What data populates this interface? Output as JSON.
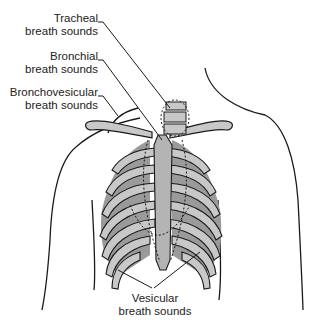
{
  "diagram": {
    "labels": [
      {
        "id": "tracheal",
        "line1": "Tracheal",
        "line2": "breath sounds"
      },
      {
        "id": "bronchial",
        "line1": "Bronchial",
        "line2": "breath sounds"
      },
      {
        "id": "bronchovesicular",
        "line1": "Bronchovesicular",
        "line2": "breath sounds"
      },
      {
        "id": "vesicular",
        "line1": "Vesicular",
        "line2": "breath sounds"
      }
    ],
    "colors": {
      "outline": "#1a1a1a",
      "rib_light": "#c8c8c8",
      "lung_dark": "#9a9a9a",
      "sternum": "#b4b4b4",
      "background": "#ffffff"
    }
  }
}
